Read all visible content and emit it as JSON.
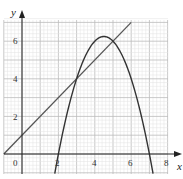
{
  "chart_data": {
    "type": "line",
    "title": "",
    "xlabel": "x",
    "ylabel": "y",
    "xlim": [
      -1,
      8
    ],
    "ylim": [
      -1,
      7
    ],
    "x_ticks": [
      "0",
      "2",
      "4",
      "6",
      "8"
    ],
    "y_ticks": [
      "2",
      "4",
      "6"
    ],
    "grid": true,
    "series": [
      {
        "name": "line",
        "equation": "y = x + 1",
        "x": [
          -1,
          0,
          3,
          5,
          6
        ],
        "y": [
          0,
          1,
          4,
          6,
          7
        ]
      },
      {
        "name": "parabola",
        "equation": "y = -(x-2)(x-7)",
        "x": [
          1.8,
          2,
          3,
          4,
          4.5,
          5,
          6,
          7,
          7.2
        ],
        "y": [
          -1.04,
          0,
          4,
          6,
          6.25,
          6,
          4,
          0,
          -1.04
        ]
      }
    ],
    "intersections": [
      [
        3,
        4
      ],
      [
        5,
        6
      ]
    ]
  },
  "labels": {
    "x_axis": "x",
    "y_axis": "y",
    "origin": "0",
    "x2": "2",
    "x4": "4",
    "x6": "6",
    "x8": "8",
    "y2": "2",
    "y4": "4",
    "y6": "6"
  }
}
